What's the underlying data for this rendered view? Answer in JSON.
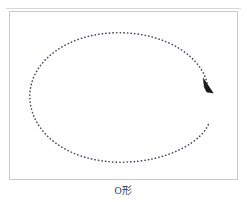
{
  "figure": {
    "caption": "O形",
    "frame": {
      "border_color": "#c9c9c9",
      "background_color": "#ffffff"
    },
    "top_rule_color": "#d8d8d8"
  },
  "gesture": {
    "name": "o-shape-gesture",
    "stroke_color": "#4a4a66",
    "arrowhead_color": "#1a1a1a",
    "path_style": "dotted",
    "direction": "clockwise",
    "start_label": "",
    "end_label": "",
    "ellipse": {
      "center_x": 119,
      "center_y": 97,
      "radius_x": 90,
      "radius_y": 66
    }
  }
}
